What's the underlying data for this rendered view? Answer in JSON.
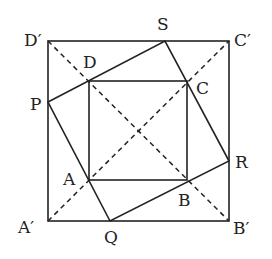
{
  "diagram": {
    "colors": {
      "stroke": "#222222",
      "background": "#ffffff"
    },
    "points": {
      "Dp": {
        "label": "D′",
        "x": 48,
        "y": 41
      },
      "Cp": {
        "label": "C′",
        "x": 229,
        "y": 41
      },
      "Bp": {
        "label": "B′",
        "x": 229,
        "y": 221
      },
      "Ap": {
        "label": "A′",
        "x": 48,
        "y": 221
      },
      "D": {
        "label": "D",
        "x": 89,
        "y": 81
      },
      "C": {
        "label": "C",
        "x": 187,
        "y": 81
      },
      "B": {
        "label": "B",
        "x": 187,
        "y": 180
      },
      "A": {
        "label": "A",
        "x": 89,
        "y": 180
      },
      "P": {
        "label": "P",
        "x": 48,
        "y": 102
      },
      "S": {
        "label": "S",
        "x": 165,
        "y": 41
      },
      "R": {
        "label": "R",
        "x": 229,
        "y": 161
      },
      "Q": {
        "label": "Q",
        "x": 110,
        "y": 221
      }
    },
    "labels": {
      "Dp": "D′",
      "Cp": "C′",
      "Bp": "B′",
      "Ap": "A′",
      "D": "D",
      "C": "C",
      "B": "B",
      "A": "A",
      "P": "P",
      "S": "S",
      "R": "R",
      "Q": "Q"
    },
    "segments": {
      "outer_square": "A′B′C′D′",
      "inner_square": "ABCD",
      "tilted_square": "PQRS",
      "dashed": [
        "A′C′",
        "D′B′"
      ]
    }
  }
}
